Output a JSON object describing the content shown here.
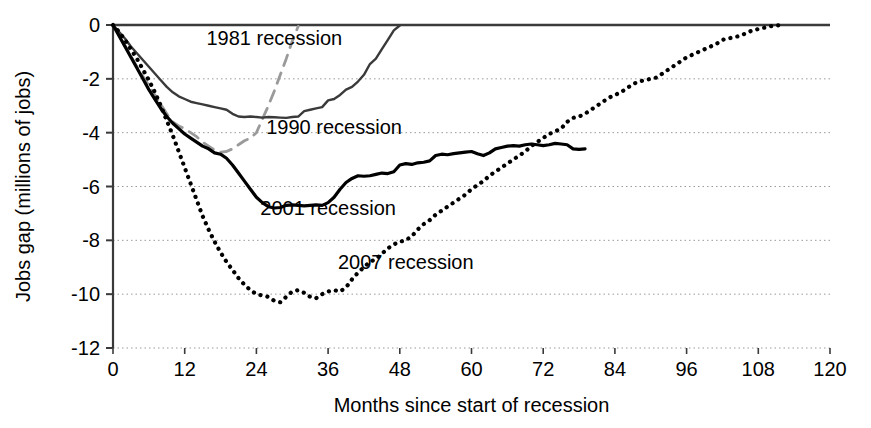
{
  "chart_data": {
    "type": "line",
    "title": "",
    "xlabel": "Months since start of recession",
    "ylabel": "Jobs gap (millions of jobs)",
    "xlim": [
      0,
      120
    ],
    "ylim": [
      -12,
      0
    ],
    "xticks": [
      0,
      12,
      24,
      36,
      48,
      60,
      72,
      84,
      96,
      108,
      120
    ],
    "xticklabels": [
      "0",
      "12",
      "24",
      "36",
      "48",
      "60",
      "72",
      "84",
      "96",
      "108",
      "120"
    ],
    "yticks": [
      0,
      -2,
      -4,
      -6,
      -8,
      -10,
      -12
    ],
    "yticklabels": [
      "0",
      "-2",
      "-4",
      "-6",
      "-8",
      "-10",
      "-12"
    ],
    "grid": "horizontal-dotted",
    "legend_position": "inline-annotations",
    "series": [
      {
        "name": "1981 recession",
        "label": "1981 recession",
        "style": "dashed",
        "color": "#9a9a9a",
        "label_x": 27,
        "label_y": -0.75,
        "points": [
          [
            0,
            0.0
          ],
          [
            1,
            -0.35
          ],
          [
            2,
            -0.75
          ],
          [
            3,
            -1.15
          ],
          [
            4,
            -1.55
          ],
          [
            5,
            -1.9
          ],
          [
            6,
            -2.25
          ],
          [
            7,
            -2.6
          ],
          [
            8,
            -2.95
          ],
          [
            9,
            -3.3
          ],
          [
            10,
            -3.6
          ],
          [
            11,
            -3.75
          ],
          [
            12,
            -3.85
          ],
          [
            13,
            -4.0
          ],
          [
            14,
            -4.15
          ],
          [
            15,
            -4.35
          ],
          [
            16,
            -4.5
          ],
          [
            17,
            -4.65
          ],
          [
            18,
            -4.72
          ],
          [
            19,
            -4.7
          ],
          [
            20,
            -4.6
          ],
          [
            21,
            -4.45
          ],
          [
            22,
            -4.3
          ],
          [
            23,
            -4.2
          ],
          [
            24,
            -4.0
          ],
          [
            25,
            -3.5
          ],
          [
            26,
            -3.0
          ],
          [
            27,
            -2.45
          ],
          [
            28,
            -1.85
          ],
          [
            29,
            -1.25
          ],
          [
            30,
            -0.6
          ],
          [
            31,
            -0.05
          ]
        ]
      },
      {
        "name": "1990 recession",
        "label": "1990 recession",
        "style": "solid",
        "color": "#3a3a3a",
        "label_x": 37,
        "label_y": -4.05,
        "points": [
          [
            0,
            0.0
          ],
          [
            1,
            -0.25
          ],
          [
            2,
            -0.5
          ],
          [
            3,
            -0.8
          ],
          [
            4,
            -1.05
          ],
          [
            5,
            -1.3
          ],
          [
            6,
            -1.55
          ],
          [
            7,
            -1.8
          ],
          [
            8,
            -2.05
          ],
          [
            9,
            -2.3
          ],
          [
            10,
            -2.5
          ],
          [
            11,
            -2.65
          ],
          [
            12,
            -2.75
          ],
          [
            13,
            -2.85
          ],
          [
            14,
            -2.9
          ],
          [
            15,
            -2.95
          ],
          [
            16,
            -3.0
          ],
          [
            17,
            -3.05
          ],
          [
            18,
            -3.1
          ],
          [
            19,
            -3.15
          ],
          [
            20,
            -3.3
          ],
          [
            21,
            -3.4
          ],
          [
            22,
            -3.42
          ],
          [
            23,
            -3.4
          ],
          [
            24,
            -3.42
          ],
          [
            25,
            -3.44
          ],
          [
            26,
            -3.42
          ],
          [
            27,
            -3.43
          ],
          [
            28,
            -3.44
          ],
          [
            29,
            -3.45
          ],
          [
            30,
            -3.42
          ],
          [
            31,
            -3.4
          ],
          [
            32,
            -3.2
          ],
          [
            33,
            -3.15
          ],
          [
            34,
            -3.1
          ],
          [
            35,
            -3.05
          ],
          [
            36,
            -2.8
          ],
          [
            37,
            -2.75
          ],
          [
            38,
            -2.6
          ],
          [
            39,
            -2.4
          ],
          [
            40,
            -2.3
          ],
          [
            41,
            -2.1
          ],
          [
            42,
            -1.85
          ],
          [
            43,
            -1.45
          ],
          [
            44,
            -1.25
          ],
          [
            45,
            -0.9
          ],
          [
            46,
            -0.55
          ],
          [
            47,
            -0.2
          ],
          [
            48,
            -0.02
          ]
        ]
      },
      {
        "name": "2001 recession",
        "label": "2001 recession",
        "style": "solid-bold",
        "color": "#000000",
        "label_x": 36,
        "label_y": -7.05,
        "points": [
          [
            0,
            0.0
          ],
          [
            1,
            -0.4
          ],
          [
            2,
            -0.8
          ],
          [
            3,
            -1.2
          ],
          [
            4,
            -1.6
          ],
          [
            5,
            -2.0
          ],
          [
            6,
            -2.4
          ],
          [
            7,
            -2.75
          ],
          [
            8,
            -3.1
          ],
          [
            9,
            -3.4
          ],
          [
            10,
            -3.65
          ],
          [
            11,
            -3.85
          ],
          [
            12,
            -4.05
          ],
          [
            13,
            -4.2
          ],
          [
            14,
            -4.35
          ],
          [
            15,
            -4.5
          ],
          [
            16,
            -4.6
          ],
          [
            17,
            -4.75
          ],
          [
            18,
            -4.8
          ],
          [
            19,
            -4.95
          ],
          [
            20,
            -5.2
          ],
          [
            21,
            -5.5
          ],
          [
            22,
            -5.8
          ],
          [
            23,
            -6.1
          ],
          [
            24,
            -6.4
          ],
          [
            25,
            -6.6
          ],
          [
            26,
            -6.75
          ],
          [
            27,
            -6.8
          ],
          [
            28,
            -6.78
          ],
          [
            29,
            -6.7
          ],
          [
            30,
            -6.68
          ],
          [
            31,
            -6.7
          ],
          [
            32,
            -6.72
          ],
          [
            33,
            -6.7
          ],
          [
            34,
            -6.68
          ],
          [
            35,
            -6.7
          ],
          [
            36,
            -6.6
          ],
          [
            37,
            -6.4
          ],
          [
            38,
            -6.1
          ],
          [
            39,
            -5.85
          ],
          [
            40,
            -5.7
          ],
          [
            41,
            -5.6
          ],
          [
            42,
            -5.62
          ],
          [
            43,
            -5.6
          ],
          [
            44,
            -5.55
          ],
          [
            45,
            -5.5
          ],
          [
            46,
            -5.52
          ],
          [
            47,
            -5.45
          ],
          [
            48,
            -5.2
          ],
          [
            49,
            -5.15
          ],
          [
            50,
            -5.18
          ],
          [
            51,
            -5.12
          ],
          [
            52,
            -5.1
          ],
          [
            53,
            -5.05
          ],
          [
            54,
            -4.85
          ],
          [
            55,
            -4.8
          ],
          [
            56,
            -4.82
          ],
          [
            57,
            -4.78
          ],
          [
            58,
            -4.75
          ],
          [
            59,
            -4.72
          ],
          [
            60,
            -4.7
          ],
          [
            61,
            -4.78
          ],
          [
            62,
            -4.85
          ],
          [
            63,
            -4.75
          ],
          [
            64,
            -4.6
          ],
          [
            65,
            -4.55
          ],
          [
            66,
            -4.5
          ],
          [
            67,
            -4.48
          ],
          [
            68,
            -4.5
          ],
          [
            69,
            -4.45
          ],
          [
            70,
            -4.42
          ],
          [
            71,
            -4.45
          ],
          [
            72,
            -4.48
          ],
          [
            73,
            -4.45
          ],
          [
            74,
            -4.4
          ],
          [
            75,
            -4.42
          ],
          [
            76,
            -4.45
          ],
          [
            77,
            -4.6
          ],
          [
            78,
            -4.62
          ],
          [
            79,
            -4.6
          ]
        ]
      },
      {
        "name": "2007 recession",
        "label": "2007 recession",
        "style": "dotted",
        "color": "#000000",
        "label_x": 49,
        "label_y": -9.05,
        "points": [
          [
            0,
            0.0
          ],
          [
            1,
            -0.25
          ],
          [
            2,
            -0.55
          ],
          [
            3,
            -0.9
          ],
          [
            4,
            -1.25
          ],
          [
            5,
            -1.65
          ],
          [
            6,
            -2.05
          ],
          [
            7,
            -2.5
          ],
          [
            8,
            -3.0
          ],
          [
            9,
            -3.55
          ],
          [
            10,
            -4.1
          ],
          [
            11,
            -4.7
          ],
          [
            12,
            -5.3
          ],
          [
            13,
            -5.9
          ],
          [
            14,
            -6.5
          ],
          [
            15,
            -7.1
          ],
          [
            16,
            -7.6
          ],
          [
            17,
            -8.05
          ],
          [
            18,
            -8.45
          ],
          [
            19,
            -8.8
          ],
          [
            20,
            -9.1
          ],
          [
            21,
            -9.4
          ],
          [
            22,
            -9.65
          ],
          [
            23,
            -9.85
          ],
          [
            24,
            -10.0
          ],
          [
            25,
            -10.05
          ],
          [
            26,
            -10.1
          ],
          [
            27,
            -10.25
          ],
          [
            28,
            -10.3
          ],
          [
            29,
            -10.1
          ],
          [
            30,
            -9.9
          ],
          [
            31,
            -9.85
          ],
          [
            32,
            -9.95
          ],
          [
            33,
            -10.1
          ],
          [
            34,
            -10.15
          ],
          [
            35,
            -10.0
          ],
          [
            36,
            -9.9
          ],
          [
            37,
            -9.85
          ],
          [
            38,
            -9.9
          ],
          [
            39,
            -9.75
          ],
          [
            40,
            -9.45
          ],
          [
            41,
            -9.2
          ],
          [
            42,
            -9.0
          ],
          [
            43,
            -8.8
          ],
          [
            44,
            -8.7
          ],
          [
            45,
            -8.5
          ],
          [
            46,
            -8.3
          ],
          [
            47,
            -8.15
          ],
          [
            48,
            -8.05
          ],
          [
            49,
            -8.0
          ],
          [
            50,
            -7.85
          ],
          [
            51,
            -7.6
          ],
          [
            52,
            -7.4
          ],
          [
            53,
            -7.25
          ],
          [
            54,
            -7.05
          ],
          [
            55,
            -6.9
          ],
          [
            56,
            -6.75
          ],
          [
            57,
            -6.6
          ],
          [
            58,
            -6.45
          ],
          [
            59,
            -6.3
          ],
          [
            60,
            -6.1
          ],
          [
            61,
            -5.95
          ],
          [
            62,
            -5.8
          ],
          [
            63,
            -5.6
          ],
          [
            64,
            -5.45
          ],
          [
            65,
            -5.3
          ],
          [
            66,
            -5.15
          ],
          [
            67,
            -5.0
          ],
          [
            68,
            -4.85
          ],
          [
            69,
            -4.7
          ],
          [
            70,
            -4.5
          ],
          [
            71,
            -4.35
          ],
          [
            72,
            -4.2
          ],
          [
            73,
            -4.05
          ],
          [
            74,
            -3.95
          ],
          [
            75,
            -3.85
          ],
          [
            76,
            -3.6
          ],
          [
            77,
            -3.45
          ],
          [
            78,
            -3.4
          ],
          [
            79,
            -3.3
          ],
          [
            80,
            -3.15
          ],
          [
            81,
            -3.0
          ],
          [
            82,
            -2.85
          ],
          [
            83,
            -2.7
          ],
          [
            84,
            -2.6
          ],
          [
            85,
            -2.5
          ],
          [
            86,
            -2.35
          ],
          [
            87,
            -2.2
          ],
          [
            88,
            -2.1
          ],
          [
            89,
            -2.05
          ],
          [
            90,
            -2.0
          ],
          [
            91,
            -1.95
          ],
          [
            92,
            -1.8
          ],
          [
            93,
            -1.65
          ],
          [
            94,
            -1.5
          ],
          [
            95,
            -1.35
          ],
          [
            96,
            -1.2
          ],
          [
            97,
            -1.1
          ],
          [
            98,
            -1.0
          ],
          [
            99,
            -0.9
          ],
          [
            100,
            -0.8
          ],
          [
            101,
            -0.7
          ],
          [
            102,
            -0.55
          ],
          [
            103,
            -0.5
          ],
          [
            104,
            -0.45
          ],
          [
            105,
            -0.4
          ],
          [
            106,
            -0.3
          ],
          [
            107,
            -0.2
          ],
          [
            108,
            -0.15
          ],
          [
            109,
            -0.1
          ],
          [
            110,
            -0.05
          ],
          [
            111,
            -0.02
          ],
          [
            112,
            0.0
          ]
        ]
      }
    ]
  }
}
